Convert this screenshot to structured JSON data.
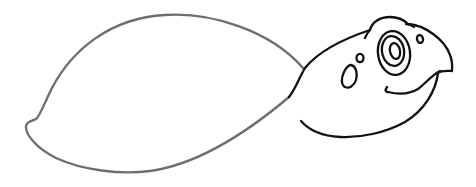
{
  "image": {
    "subject": "Cartoon turtle line drawing (coloring page style)",
    "background_color": "#ffffff",
    "colors": {
      "shell_outline": "#6e6e6e",
      "head_outline": "#111111"
    },
    "parts": [
      {
        "name": "shell",
        "description": "Large oval shell outline with small notch at left tail end"
      },
      {
        "name": "head",
        "description": "Rounded turtle head with bump on top and hooked beak"
      },
      {
        "name": "eye",
        "description": "Concentric ellipses with oval pupil"
      },
      {
        "name": "nostril",
        "description": "Small oval"
      },
      {
        "name": "cheek-spots",
        "description": "One large teardrop spot and one small round spot"
      },
      {
        "name": "smile",
        "description": "Curved mouth line under the beak"
      }
    ]
  }
}
